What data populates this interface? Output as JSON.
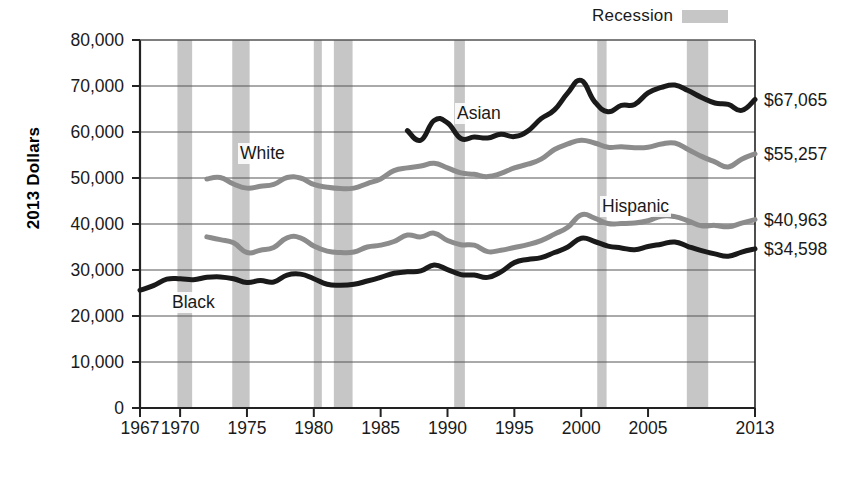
{
  "legend": {
    "label": "Recession",
    "swatch_color": "#c6c6c6"
  },
  "axis": {
    "ylabel": "2013 Dollars",
    "yticks": [
      "0",
      "10,000",
      "20,000",
      "30,000",
      "40,000",
      "50,000",
      "60,000",
      "70,000",
      "80,000"
    ],
    "xticks": [
      "1967",
      "1970",
      "1975",
      "1980",
      "1985",
      "1990",
      "1995",
      "2000",
      "2005",
      "2013"
    ]
  },
  "end_labels": [
    {
      "text": "$67,065",
      "series": "Asian",
      "value": 67065
    },
    {
      "text": "$55,257",
      "series": "White",
      "value": 55257
    },
    {
      "text": "$40,963",
      "series": "Hispanic",
      "value": 40963
    },
    {
      "text": "$34,598",
      "series": "Black",
      "value": 34598
    }
  ],
  "series_tags": [
    {
      "text": "Asian"
    },
    {
      "text": "White"
    },
    {
      "text": "Hispanic"
    },
    {
      "text": "Black"
    }
  ],
  "chart_data": {
    "type": "line",
    "title": "",
    "xlabel": "",
    "ylabel": "2013 Dollars",
    "xlim": [
      1967,
      2013
    ],
    "ylim": [
      0,
      80000
    ],
    "ytick_values": [
      0,
      10000,
      20000,
      30000,
      40000,
      50000,
      60000,
      70000,
      80000
    ],
    "xtick_values": [
      1967,
      1970,
      1975,
      1980,
      1985,
      1990,
      1995,
      2000,
      2005,
      2013
    ],
    "grid": true,
    "legend_position": "top-right",
    "shaded_regions": {
      "name": "Recession",
      "color": "#c6c6c6",
      "bands": [
        [
          1969.8,
          1970.9
        ],
        [
          1973.9,
          1975.2
        ],
        [
          1980.0,
          1980.6
        ],
        [
          1981.5,
          1982.9
        ],
        [
          1990.5,
          1991.3
        ],
        [
          2001.2,
          2001.9
        ],
        [
          2007.9,
          2009.5
        ]
      ]
    },
    "series": [
      {
        "name": "Asian",
        "color": "#1a1a1a",
        "end_value": 67065,
        "x": [
          1987,
          1988,
          1989,
          1990,
          1991,
          1992,
          1993,
          1994,
          1995,
          1996,
          1997,
          1998,
          1999,
          2000,
          2001,
          2002,
          2003,
          2004,
          2005,
          2006,
          2007,
          2008,
          2009,
          2010,
          2011,
          2012,
          2013
        ],
        "values": [
          60300,
          58200,
          62500,
          62000,
          58600,
          58900,
          58700,
          59500,
          59000,
          60200,
          62900,
          64800,
          68500,
          71200,
          66600,
          64400,
          65800,
          66000,
          68500,
          69700,
          70200,
          69000,
          67500,
          66300,
          66000,
          64700,
          67065
        ]
      },
      {
        "name": "White",
        "color": "#8c8c8c",
        "end_value": 55257,
        "x": [
          1972,
          1973,
          1974,
          1975,
          1976,
          1977,
          1978,
          1979,
          1980,
          1981,
          1982,
          1983,
          1984,
          1985,
          1986,
          1987,
          1988,
          1989,
          1990,
          1991,
          1992,
          1993,
          1994,
          1995,
          1996,
          1997,
          1998,
          1999,
          2000,
          2001,
          2002,
          2003,
          2004,
          2005,
          2006,
          2007,
          2008,
          2009,
          2010,
          2011,
          2012,
          2013
        ],
        "values": [
          49800,
          50100,
          48700,
          47800,
          48200,
          48600,
          50100,
          50000,
          48600,
          48000,
          47700,
          47800,
          48800,
          49800,
          51600,
          52200,
          52600,
          53200,
          52200,
          51100,
          50800,
          50300,
          51000,
          52200,
          53000,
          54100,
          56200,
          57400,
          58200,
          57600,
          56700,
          56800,
          56600,
          56700,
          57400,
          57600,
          56200,
          54700,
          53500,
          52400,
          54100,
          55257
        ]
      },
      {
        "name": "Hispanic",
        "color": "#8c8c8c",
        "end_value": 40963,
        "x": [
          1972,
          1973,
          1974,
          1975,
          1976,
          1977,
          1978,
          1979,
          1980,
          1981,
          1982,
          1983,
          1984,
          1985,
          1986,
          1987,
          1988,
          1989,
          1990,
          1991,
          1992,
          1993,
          1994,
          1995,
          1996,
          1997,
          1998,
          1999,
          2000,
          2001,
          2002,
          2003,
          2004,
          2005,
          2006,
          2007,
          2008,
          2009,
          2010,
          2011,
          2012,
          2013
        ],
        "values": [
          37200,
          36600,
          35900,
          33800,
          34300,
          34900,
          37000,
          37000,
          35200,
          34100,
          33800,
          33900,
          35000,
          35400,
          36200,
          37600,
          37200,
          38000,
          36400,
          35500,
          35400,
          34000,
          34300,
          34900,
          35500,
          36400,
          37800,
          39300,
          42000,
          41300,
          40100,
          40100,
          40200,
          40700,
          41700,
          41600,
          40700,
          39600,
          39700,
          39400,
          40200,
          40963
        ]
      },
      {
        "name": "Black",
        "color": "#1a1a1a",
        "end_value": 34598,
        "x": [
          1967,
          1968,
          1969,
          1970,
          1971,
          1972,
          1973,
          1974,
          1975,
          1976,
          1977,
          1978,
          1979,
          1980,
          1981,
          1982,
          1983,
          1984,
          1985,
          1986,
          1987,
          1988,
          1989,
          1990,
          1991,
          1992,
          1993,
          1994,
          1995,
          1996,
          1997,
          1998,
          1999,
          2000,
          2001,
          2002,
          2003,
          2004,
          2005,
          2006,
          2007,
          2008,
          2009,
          2010,
          2011,
          2012,
          2013
        ],
        "values": [
          25600,
          26600,
          28000,
          28100,
          27900,
          28400,
          28500,
          28100,
          27300,
          27700,
          27400,
          28900,
          29100,
          28100,
          26900,
          26700,
          26900,
          27600,
          28400,
          29300,
          29600,
          29800,
          31100,
          30100,
          29000,
          28900,
          28400,
          29600,
          31600,
          32300,
          32700,
          33800,
          35000,
          36900,
          36200,
          35200,
          34800,
          34400,
          35100,
          35600,
          36100,
          35100,
          34200,
          33500,
          33000,
          33900,
          34598
        ]
      }
    ]
  }
}
